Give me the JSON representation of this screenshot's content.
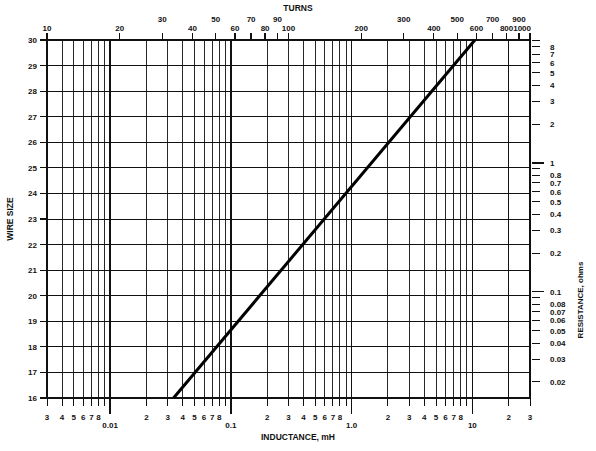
{
  "figure": {
    "background_color": "#ffffff",
    "line_color": "#111111",
    "curve_color": "#000000"
  },
  "axes": {
    "top": {
      "title": "TURNS",
      "scale": "log",
      "min": 10,
      "max": 1000,
      "major_labels": [
        "10",
        "20",
        "30",
        "40",
        "50",
        "60",
        "70",
        "80",
        "90",
        "100",
        "200",
        "300",
        "400",
        "500",
        "600",
        "700",
        "800",
        "900",
        "1000"
      ],
      "major_values": [
        10,
        20,
        30,
        40,
        50,
        60,
        70,
        80,
        90,
        100,
        200,
        300,
        400,
        500,
        600,
        700,
        800,
        900,
        1000
      ]
    },
    "bottom": {
      "title": "INDUCTANCE, mH",
      "scale": "log",
      "min": 0.003,
      "max": 30,
      "decade_labels": [
        "0.01",
        "0.1",
        "1.0",
        "10"
      ],
      "decade_values": [
        0.01,
        0.1,
        1,
        10
      ],
      "minor_labels": [
        "3",
        "4",
        "5",
        "6",
        "7",
        "8"
      ],
      "minor_tail_labels": [
        "2",
        "3"
      ]
    },
    "left": {
      "title": "WIRE SIZE",
      "scale": "linear",
      "min": 16,
      "max": 30,
      "labels": [
        "30",
        "29",
        "28",
        "27",
        "26",
        "25",
        "24",
        "23",
        "22",
        "21",
        "20",
        "19",
        "18",
        "17",
        "16"
      ],
      "values": [
        30,
        29,
        28,
        27,
        26,
        25,
        24,
        23,
        22,
        21,
        20,
        19,
        18,
        17,
        16
      ]
    },
    "right": {
      "title": "RESISTANCE, ohms",
      "scale": "log",
      "min": 0.015,
      "max": 9,
      "labels": [
        "8",
        "7",
        "6",
        "5",
        "4",
        "3",
        "2",
        "1",
        "0.8",
        "0.7",
        "0.6",
        "0.5",
        "0.4",
        "0.3",
        "0.2",
        "0.1",
        "0.08",
        "0.07",
        "0.06",
        "0.05",
        "0.04",
        "0.03",
        "0.02"
      ],
      "values": [
        8,
        7,
        6,
        5,
        4,
        3,
        2,
        1,
        0.8,
        0.7,
        0.6,
        0.5,
        0.4,
        0.3,
        0.2,
        0.1,
        0.08,
        0.07,
        0.06,
        0.05,
        0.04,
        0.03,
        0.02
      ]
    }
  },
  "chart_data": {
    "type": "line",
    "title": "TURNS",
    "xlabel": "INDUCTANCE, mH",
    "ylabel": "WIRE SIZE",
    "y2label": "RESISTANCE, ohms",
    "xlim": [
      0.003,
      30
    ],
    "ylim": [
      16,
      30
    ],
    "x2lim": [
      10,
      1000
    ],
    "y2lim": [
      0.015,
      9
    ],
    "grid": true,
    "legend": "none",
    "series": [
      {
        "name": "design line",
        "x": [
          0.0335,
          10.5
        ],
        "y": [
          16.0,
          30.0
        ],
        "turns": [
          36,
          830
        ],
        "resistance": [
          0.0155,
          9.0
        ],
        "points": [
          {
            "inductance_mH": 0.0335,
            "wire_size": 16,
            "turns": 36,
            "resistance_ohms": 0.0155
          },
          {
            "inductance_mH": 0.1,
            "wire_size": 18.4,
            "turns": 62,
            "resistance_ohms": 0.043
          },
          {
            "inductance_mH": 0.33,
            "wire_size": 21.0,
            "turns": 112,
            "resistance_ohms": 0.14
          },
          {
            "inductance_mH": 1.0,
            "wire_size": 23.4,
            "turns": 196,
            "resistance_ohms": 0.4
          },
          {
            "inductance_mH": 3.3,
            "wire_size": 26.0,
            "turns": 350,
            "resistance_ohms": 1.3
          },
          {
            "inductance_mH": 10.5,
            "wire_size": 30.0,
            "turns": 830,
            "resistance_ohms": 9.0
          }
        ]
      }
    ]
  }
}
